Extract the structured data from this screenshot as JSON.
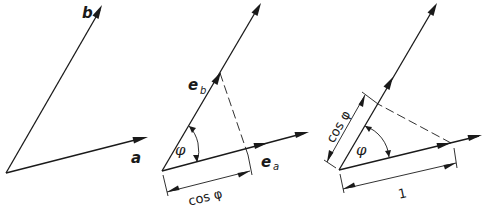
{
  "figure": {
    "panels": [
      {
        "id": "panel-1",
        "vectors": [
          {
            "label": "b",
            "from": [
              6,
              173
            ],
            "to": [
              102,
              6
            ]
          },
          {
            "label": "a",
            "from": [
              6,
              173
            ],
            "to": [
              147,
              137
            ]
          }
        ]
      },
      {
        "id": "panel-2",
        "vectors": [
          {
            "label": "e",
            "subscript": "b",
            "from": [
              162,
              171
            ],
            "to": [
              220,
              73
            ]
          },
          {
            "label": "e",
            "subscript": "a",
            "from": [
              162,
              171
            ],
            "to": [
              266,
              143
            ]
          }
        ],
        "angle_label": "φ",
        "dimension_label": "cos φ"
      },
      {
        "id": "panel-3",
        "angle_label": "φ",
        "dimension_label_side": "cos φ",
        "dimension_label_base": "1"
      }
    ],
    "labels": {
      "b": "b",
      "a": "a",
      "e": "e",
      "sub_b": "b",
      "sub_a": "a",
      "phi": "φ",
      "cos_phi": "cos φ",
      "one": "1"
    },
    "colors": {
      "ink": "#1a1a1a",
      "background": "#ffffff"
    }
  }
}
